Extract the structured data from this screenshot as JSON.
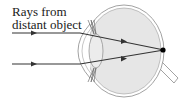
{
  "diagram": {
    "label_line1": "Rays from",
    "label_line2": "distant object",
    "colors": {
      "eyeball_fill": "#e6e6e6",
      "outline": "#8a8a8a",
      "ray": "#333333",
      "focal_point": "#000000"
    }
  }
}
